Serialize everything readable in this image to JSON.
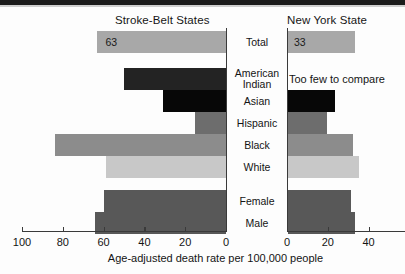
{
  "chart_data": {
    "type": "bar",
    "title": "",
    "xlabel": "Age-adjusted death rate per 100,000 people",
    "ylabel": "",
    "orientation": "horizontal",
    "grid": false,
    "legend": false,
    "panels": [
      {
        "name": "left",
        "title": "Stroke-Belt States",
        "direction": "rightToLeft",
        "xlim": [
          0,
          105
        ],
        "ticks": [
          100,
          80,
          60,
          40,
          20,
          0
        ],
        "tick_labels": [
          "100",
          "80",
          "60",
          "40",
          "20",
          "0"
        ]
      },
      {
        "name": "right",
        "title": "New York State",
        "direction": "leftToRight",
        "xlim": [
          0,
          58
        ],
        "ticks": [
          0,
          20,
          40
        ],
        "tick_labels": [
          "0",
          "20",
          "40"
        ]
      }
    ],
    "categories": [
      "Total",
      "American Indian",
      "Asian",
      "Hispanic",
      "Black",
      "White",
      "Female",
      "Male"
    ],
    "series": [
      {
        "name": "Stroke-Belt States",
        "values": [
          63,
          50,
          31,
          15,
          84,
          59,
          60,
          64
        ]
      },
      {
        "name": "New York State",
        "values": [
          33,
          null,
          23,
          19,
          32,
          35,
          31,
          33
        ]
      }
    ],
    "rows": [
      {
        "category": "Total",
        "category_line1": "Total",
        "category_line2": "",
        "left_value": 63,
        "left_label": "63",
        "left_color": "#a8a8a8",
        "right_value": 33,
        "right_label": "33",
        "right_color": "#a8a8a8",
        "right_note": ""
      },
      {
        "category": "American Indian",
        "category_line1": "American",
        "category_line2": "Indian",
        "left_value": 50,
        "left_label": "",
        "left_color": "#232323",
        "right_value": 0,
        "right_label": "",
        "right_color": "transparent",
        "right_note": "Too few to compare"
      },
      {
        "category": "Asian",
        "category_line1": "Asian",
        "category_line2": "",
        "left_value": 31,
        "left_label": "",
        "left_color": "#070707",
        "right_value": 23,
        "right_label": "",
        "right_color": "#070707",
        "right_note": ""
      },
      {
        "category": "Hispanic",
        "category_line1": "Hispanic",
        "category_line2": "",
        "left_value": 15,
        "left_label": "",
        "left_color": "#6d6d6d",
        "right_value": 19,
        "right_label": "",
        "right_color": "#6d6d6d",
        "right_note": ""
      },
      {
        "category": "Black",
        "category_line1": "Black",
        "category_line2": "",
        "left_value": 84,
        "left_label": "",
        "left_color": "#8c8c8c",
        "right_value": 32,
        "right_label": "",
        "right_color": "#8c8c8c",
        "right_note": ""
      },
      {
        "category": "White",
        "category_line1": "White",
        "category_line2": "",
        "left_value": 59,
        "left_label": "",
        "left_color": "#c8c8c8",
        "right_value": 35,
        "right_label": "",
        "right_color": "#c8c8c8",
        "right_note": ""
      },
      {
        "category": "Female",
        "category_line1": "Female",
        "category_line2": "",
        "left_value": 60,
        "left_label": "",
        "left_color": "#585858",
        "right_value": 31,
        "right_label": "",
        "right_color": "#585858",
        "right_note": ""
      },
      {
        "category": "Male",
        "category_line1": "Male",
        "category_line2": "",
        "left_value": 64,
        "left_label": "",
        "left_color": "#585858",
        "right_value": 33,
        "right_label": "",
        "right_color": "#585858",
        "right_note": ""
      }
    ],
    "notes": [
      "Too few to compare"
    ]
  }
}
